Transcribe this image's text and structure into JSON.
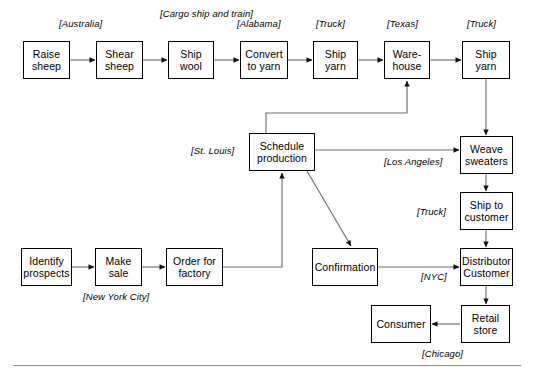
{
  "diagram": {
    "type": "flowchart",
    "nodes": [
      {
        "id": "raise_sheep",
        "label": "Raise\nsheep",
        "x": 23,
        "y": 41,
        "w": 47,
        "h": 38
      },
      {
        "id": "shear_sheep",
        "label": "Shear\nsheep",
        "x": 96,
        "y": 41,
        "w": 47,
        "h": 38
      },
      {
        "id": "ship_wool",
        "label": "Ship\nwool",
        "x": 168,
        "y": 41,
        "w": 46,
        "h": 38
      },
      {
        "id": "convert_to_yarn",
        "label": "Convert\nto yarn",
        "x": 240,
        "y": 41,
        "w": 48,
        "h": 38
      },
      {
        "id": "ship_yarn_1",
        "label": "Ship\nyarn",
        "x": 313,
        "y": 41,
        "w": 45,
        "h": 38
      },
      {
        "id": "warehouse",
        "label": "Ware-\nhouse",
        "x": 384,
        "y": 41,
        "w": 46,
        "h": 38
      },
      {
        "id": "ship_yarn_2",
        "label": "Ship\nyarn",
        "x": 462,
        "y": 41,
        "w": 48,
        "h": 38
      },
      {
        "id": "schedule_production",
        "label": "Schedule\nproduction",
        "x": 249,
        "y": 133,
        "w": 66,
        "h": 38
      },
      {
        "id": "weave_sweaters",
        "label": "Weave\nsweaters",
        "x": 460,
        "y": 136,
        "w": 53,
        "h": 38
      },
      {
        "id": "ship_to_customer",
        "label": "Ship to\ncustomer",
        "x": 460,
        "y": 192,
        "w": 53,
        "h": 38
      },
      {
        "id": "distributor",
        "label": "Distributor\nCustomer",
        "x": 460,
        "y": 248,
        "w": 53,
        "h": 38
      },
      {
        "id": "retail_store",
        "label": "Retail\nstore",
        "x": 461,
        "y": 305,
        "w": 49,
        "h": 38
      },
      {
        "id": "consumer",
        "label": "Consumer",
        "x": 371,
        "y": 305,
        "w": 60,
        "h": 38
      },
      {
        "id": "confirmation",
        "label": "Confirmation",
        "x": 312,
        "y": 248,
        "w": 66,
        "h": 38
      },
      {
        "id": "identify_prospects",
        "label": "Identify\nprospects",
        "x": 21,
        "y": 248,
        "w": 51,
        "h": 38
      },
      {
        "id": "make_sale",
        "label": "Make\nsale",
        "x": 95,
        "y": 248,
        "w": 47,
        "h": 38
      },
      {
        "id": "order_for_factory",
        "label": "Order for\nfactory",
        "x": 166,
        "y": 248,
        "w": 57,
        "h": 38
      }
    ],
    "location_tags": [
      {
        "id": "tag_australia",
        "label": "[Australia]",
        "x": 59,
        "y": 18,
        "align": "center"
      },
      {
        "id": "tag_cargo",
        "label": "[Cargo ship\nand train]",
        "x": 160,
        "y": 8,
        "align": "center"
      },
      {
        "id": "tag_alabama",
        "label": "[Alabama]",
        "x": 237,
        "y": 18,
        "align": "left"
      },
      {
        "id": "tag_truck_1",
        "label": "[Truck]",
        "x": 316,
        "y": 18,
        "align": "left"
      },
      {
        "id": "tag_texas",
        "label": "[Texas]",
        "x": 387,
        "y": 18,
        "align": "left"
      },
      {
        "id": "tag_truck_2",
        "label": "[Truck]",
        "x": 467,
        "y": 18,
        "align": "left"
      },
      {
        "id": "tag_st_louis",
        "label": "[St. Louis]",
        "x": 191,
        "y": 145,
        "align": "left"
      },
      {
        "id": "tag_los_angeles",
        "label": "[Los Angeles]",
        "x": 384,
        "y": 156,
        "align": "left"
      },
      {
        "id": "tag_truck_3",
        "label": "[Truck]",
        "x": 417,
        "y": 206,
        "align": "left"
      },
      {
        "id": "tag_nyc",
        "label": "[NYC]",
        "x": 421,
        "y": 271,
        "align": "left"
      },
      {
        "id": "tag_new_york",
        "label": "[New York City]",
        "x": 83,
        "y": 291,
        "align": "left"
      },
      {
        "id": "tag_chicago",
        "label": "[Chicago]",
        "x": 422,
        "y": 348,
        "align": "left"
      }
    ],
    "edges": [
      {
        "id": "e_raise_shear",
        "from": "raise_sheep",
        "to": "shear_sheep",
        "style": "arrow-right"
      },
      {
        "id": "e_shear_wool",
        "from": "shear_sheep",
        "to": "ship_wool",
        "style": "arrow-right"
      },
      {
        "id": "e_wool_convert",
        "from": "ship_wool",
        "to": "convert_to_yarn",
        "style": "arrow-right"
      },
      {
        "id": "e_convert_ship",
        "from": "convert_to_yarn",
        "to": "ship_yarn_1",
        "style": "arrow-right"
      },
      {
        "id": "e_ship_warehouse",
        "from": "ship_yarn_1",
        "to": "warehouse",
        "style": "arrow-right"
      },
      {
        "id": "e_warehouse_ship",
        "from": "warehouse",
        "to": "ship_yarn_2",
        "style": "arrow-right"
      },
      {
        "id": "e_ship2_weave",
        "from": "ship_yarn_2",
        "to": "weave_sweaters",
        "style": "arrow-down"
      },
      {
        "id": "e_sched_warehouse",
        "from": "schedule_production",
        "to": "warehouse",
        "style": "elbow-up-right"
      },
      {
        "id": "e_sched_weave",
        "from": "schedule_production",
        "to": "weave_sweaters",
        "style": "arrow-right"
      },
      {
        "id": "e_sched_confirm",
        "from": "schedule_production",
        "to": "confirmation",
        "style": "diagonal-arrow"
      },
      {
        "id": "e_order_sched",
        "from": "order_for_factory",
        "to": "schedule_production",
        "style": "elbow-right-up"
      },
      {
        "id": "e_weave_shipcust",
        "from": "weave_sweaters",
        "to": "ship_to_customer",
        "style": "arrow-down"
      },
      {
        "id": "e_shipcust_dist",
        "from": "ship_to_customer",
        "to": "distributor",
        "style": "arrow-down"
      },
      {
        "id": "e_confirm_dist",
        "from": "confirmation",
        "to": "distributor",
        "style": "arrow-right"
      },
      {
        "id": "e_dist_retail",
        "from": "distributor",
        "to": "retail_store",
        "style": "arrow-down"
      },
      {
        "id": "e_retail_consumer",
        "from": "retail_store",
        "to": "consumer",
        "style": "arrow-left"
      },
      {
        "id": "e_identify_makesale",
        "from": "identify_prospects",
        "to": "make_sale",
        "style": "arrow-right"
      },
      {
        "id": "e_makesale_order",
        "from": "make_sale",
        "to": "order_for_factory",
        "style": "arrow-right"
      }
    ],
    "footer_rule": {
      "id": "bottom-divider",
      "x": 13,
      "y": 365,
      "w": 508
    }
  }
}
